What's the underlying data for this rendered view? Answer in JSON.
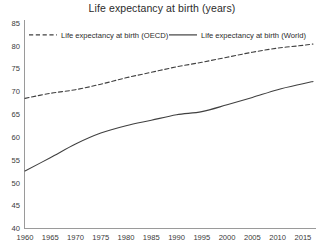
{
  "chart_data": {
    "type": "line",
    "title": "Life expectancy at birth (years)",
    "xlabel": "",
    "ylabel": "",
    "xlim": [
      1960,
      2017
    ],
    "ylim": [
      40,
      85
    ],
    "ytick_step": 5,
    "xtick_step": 5,
    "grid": false,
    "legend_position": "top-inside",
    "xticks": [
      "1960",
      "1965",
      "1970",
      "1975",
      "1980",
      "1985",
      "1990",
      "1995",
      "2000",
      "2005",
      "2010",
      "2015"
    ],
    "yticks": [
      "40",
      "45",
      "50",
      "55",
      "60",
      "65",
      "70",
      "75",
      "80",
      "85"
    ],
    "x": [
      1960,
      1965,
      1970,
      1975,
      1980,
      1985,
      1990,
      1995,
      2000,
      2005,
      2010,
      2015,
      2017
    ],
    "series": [
      {
        "name": "Life expectancy at birth (OECD)",
        "style": "dashed",
        "color": "#404040",
        "values": [
          68.5,
          69.6,
          70.4,
          71.6,
          73.0,
          74.2,
          75.4,
          76.4,
          77.5,
          78.6,
          79.5,
          80.1,
          80.4
        ]
      },
      {
        "name": "Life expectancy at birth (World)",
        "style": "solid",
        "color": "#404040",
        "values": [
          52.6,
          55.5,
          58.5,
          60.9,
          62.5,
          63.7,
          64.9,
          65.6,
          67.1,
          68.7,
          70.4,
          71.7,
          72.2
        ]
      }
    ]
  },
  "legend": {
    "entries": [
      {
        "label": "Life expectancy at birth (OECD)",
        "style": "dashed"
      },
      {
        "label": "Life expectancy at birth (World)",
        "style": "solid"
      }
    ]
  }
}
